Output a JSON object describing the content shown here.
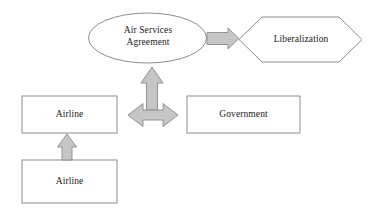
{
  "diagram": {
    "type": "flow-diagram",
    "background_color": "#ffffff",
    "shape_outline_color": "#808080",
    "arrow_fill_color": "#c6c6c6",
    "arrow_outline_color": "#8a8a8a",
    "text_color": "#1a1a1a",
    "nodes": [
      {
        "id": "air-services-agreement",
        "label": "Air Services\nAgreement",
        "shape": "ellipse"
      },
      {
        "id": "liberalization",
        "label": "Liberalization",
        "shape": "hexagon"
      },
      {
        "id": "airline-upper",
        "label": "Airline",
        "shape": "rectangle"
      },
      {
        "id": "airline-lower",
        "label": "Airline",
        "shape": "rectangle"
      },
      {
        "id": "government",
        "label": "Government",
        "shape": "rectangle"
      }
    ],
    "connectors": [
      {
        "id": "asa-to-liberalization",
        "from": "air-services-agreement",
        "to": "liberalization",
        "direction": "right",
        "style": "block-arrow"
      },
      {
        "id": "airline-government-to-asa",
        "from": "airline-government-link",
        "to": "air-services-agreement",
        "direction": "up",
        "style": "block-arrow"
      },
      {
        "id": "airline-to-government",
        "from": "airline-upper",
        "to": "government",
        "direction": "bidirectional-horizontal",
        "style": "block-arrow"
      },
      {
        "id": "airline-lower-to-airline-upper",
        "from": "airline-lower",
        "to": "airline-upper",
        "direction": "up",
        "style": "block-arrow"
      }
    ]
  }
}
